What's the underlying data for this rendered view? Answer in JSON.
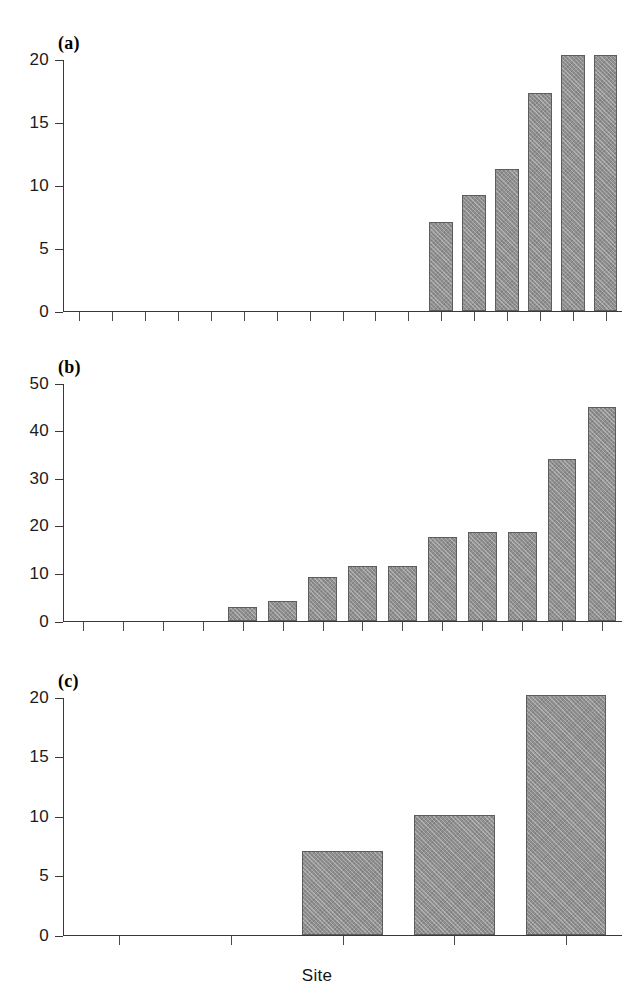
{
  "figure": {
    "xlabel": "Site",
    "bar_fill": "#8f8f8f",
    "bar_stroke": "#5d5d5d",
    "axis_color": "#3a3a3a",
    "background": "#ffffff"
  },
  "panels": [
    {
      "id": "a",
      "label": "(a)"
    },
    {
      "id": "b",
      "label": "(b)"
    },
    {
      "id": "c",
      "label": "(c)"
    }
  ],
  "chart_data": [
    {
      "type": "bar",
      "title": "(a)",
      "xlabel": "",
      "ylabel": "",
      "ylim": [
        0,
        20
      ],
      "yticks": [
        0,
        5,
        10,
        15,
        20
      ],
      "ytick_labels": [
        "0",
        "5",
        "10",
        "15",
        "20"
      ],
      "grid": false,
      "legend": "none",
      "n_x_positions": 17,
      "categories": [
        "1",
        "2",
        "3",
        "4",
        "5",
        "6",
        "7",
        "8",
        "9",
        "10",
        "11",
        "12",
        "13",
        "14",
        "15",
        "16",
        "17"
      ],
      "values": [
        0,
        0,
        0,
        0,
        0,
        0,
        0,
        0,
        0,
        0,
        0,
        7.1,
        9.2,
        11.3,
        17.3,
        20.3,
        20.3
      ]
    },
    {
      "type": "bar",
      "title": "(b)",
      "xlabel": "",
      "ylabel": "",
      "ylim": [
        0,
        50
      ],
      "yticks": [
        0,
        10,
        20,
        30,
        40,
        50
      ],
      "ytick_labels": [
        "0",
        "10",
        "20",
        "30",
        "40",
        "50"
      ],
      "grid": false,
      "legend": "none",
      "n_x_positions": 14,
      "categories": [
        "1",
        "2",
        "3",
        "4",
        "5",
        "6",
        "7",
        "8",
        "9",
        "10",
        "11",
        "12",
        "13",
        "14"
      ],
      "values": [
        0,
        0,
        0,
        0,
        3.0,
        4.1,
        9.2,
        11.5,
        11.5,
        17.6,
        18.7,
        18.6,
        34.0,
        45.0
      ]
    },
    {
      "type": "bar",
      "title": "(c)",
      "xlabel": "Site",
      "ylabel": "",
      "ylim": [
        0,
        20
      ],
      "yticks": [
        0,
        5,
        10,
        15,
        20
      ],
      "ytick_labels": [
        "0",
        "5",
        "10",
        "15",
        "20"
      ],
      "grid": false,
      "legend": "none",
      "n_x_positions": 5,
      "categories": [
        "1",
        "2",
        "3",
        "4",
        "5"
      ],
      "values": [
        0,
        0,
        7.1,
        10.1,
        20.2
      ]
    }
  ]
}
